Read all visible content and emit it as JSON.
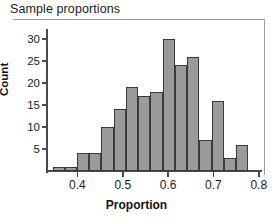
{
  "chart_data": {
    "type": "bar",
    "title": "Sample proportions",
    "xlabel": "Proportion",
    "ylabel": "Count",
    "grid": false,
    "legend": null,
    "xlim": [
      0.335,
      0.805
    ],
    "ylim": [
      0,
      31.6
    ],
    "xticks": [
      "0.4",
      "0.5",
      "0.6",
      "0.7",
      "0.8"
    ],
    "xtick_values": [
      0.4,
      0.5,
      0.6,
      0.7,
      0.8
    ],
    "yticks": [
      "5",
      "10",
      "15",
      "20",
      "25",
      "30"
    ],
    "ytick_values": [
      5,
      10,
      15,
      20,
      25,
      30
    ],
    "bin_width": 0.027,
    "bins": [
      {
        "x0": 0.345,
        "x1": 0.372,
        "center": 0.358,
        "count": 1
      },
      {
        "x0": 0.372,
        "x1": 0.399,
        "center": 0.385,
        "count": 1
      },
      {
        "x0": 0.399,
        "x1": 0.426,
        "center": 0.412,
        "count": 4
      },
      {
        "x0": 0.426,
        "x1": 0.453,
        "center": 0.439,
        "count": 4
      },
      {
        "x0": 0.453,
        "x1": 0.48,
        "center": 0.466,
        "count": 10
      },
      {
        "x0": 0.48,
        "x1": 0.507,
        "center": 0.493,
        "count": 14
      },
      {
        "x0": 0.507,
        "x1": 0.534,
        "center": 0.52,
        "count": 19
      },
      {
        "x0": 0.534,
        "x1": 0.561,
        "center": 0.547,
        "count": 17
      },
      {
        "x0": 0.561,
        "x1": 0.588,
        "center": 0.574,
        "count": 18
      },
      {
        "x0": 0.588,
        "x1": 0.615,
        "center": 0.601,
        "count": 30
      },
      {
        "x0": 0.615,
        "x1": 0.642,
        "center": 0.628,
        "count": 24
      },
      {
        "x0": 0.642,
        "x1": 0.669,
        "center": 0.655,
        "count": 26
      },
      {
        "x0": 0.669,
        "x1": 0.696,
        "center": 0.682,
        "count": 7
      },
      {
        "x0": 0.696,
        "x1": 0.723,
        "center": 0.709,
        "count": 16
      },
      {
        "x0": 0.723,
        "x1": 0.75,
        "center": 0.736,
        "count": 3
      },
      {
        "x0": 0.75,
        "x1": 0.777,
        "center": 0.763,
        "count": 6
      }
    ],
    "categories": [
      0.358,
      0.385,
      0.412,
      0.439,
      0.466,
      0.493,
      0.52,
      0.547,
      0.574,
      0.601,
      0.628,
      0.655,
      0.682,
      0.709,
      0.736,
      0.763
    ],
    "values": [
      1,
      1,
      4,
      4,
      10,
      14,
      19,
      17,
      18,
      30,
      24,
      26,
      7,
      16,
      3,
      6
    ],
    "colors": {
      "bar_fill": "#9a9a9a",
      "bar_edge": "#3a3a3a",
      "axis": "#4a4a4a",
      "frame": "#9d9d9d",
      "text": "#1b1b1b",
      "background": "#ffffff"
    }
  }
}
